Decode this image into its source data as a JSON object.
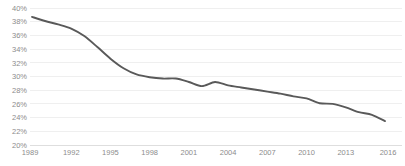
{
  "chart_data": {
    "type": "line",
    "title": "",
    "subtitle": "",
    "xlabel": "",
    "ylabel": "",
    "xlim": [
      1989,
      2016
    ],
    "ylim": [
      20,
      40
    ],
    "ytick_step": 2,
    "xtick_step": 3,
    "grid": true,
    "legend": false,
    "legend_position": "none",
    "value_suffix": "%",
    "line_color": "#595959",
    "grid_color": "#e8e8e8",
    "tick_label_color": "#8c8c8c",
    "background_color": "#ffffff",
    "ytick_labels": [
      "40%",
      "38%",
      "36%",
      "34%",
      "32%",
      "30%",
      "28%",
      "26%",
      "24%",
      "22%",
      "20%"
    ],
    "ytick_values": [
      40,
      38,
      36,
      34,
      32,
      30,
      28,
      26,
      24,
      22,
      20
    ],
    "xtick_labels": [
      "1989",
      "1992",
      "1995",
      "1998",
      "2001",
      "2004",
      "2007",
      "2010",
      "2013",
      "2016"
    ],
    "xtick_values": [
      1989,
      1992,
      1995,
      1998,
      2001,
      2004,
      2007,
      2010,
      2013,
      2016
    ],
    "series": [
      {
        "name": "share",
        "color": "#595959",
        "x": [
          1989,
          1990,
          1991,
          1992,
          1993,
          1994,
          1995,
          1996,
          1997,
          1998,
          1999,
          2000,
          2001,
          2002,
          2003,
          2004,
          2005,
          2006,
          2007,
          2008,
          2009,
          2010,
          2011,
          2012,
          2013,
          2014,
          2015,
          2016
        ],
        "values": [
          38.7,
          38.1,
          37.6,
          37.0,
          35.9,
          34.3,
          32.6,
          31.2,
          30.3,
          29.9,
          29.7,
          29.7,
          29.2,
          28.6,
          29.2,
          28.7,
          28.4,
          28.1,
          27.8,
          27.5,
          27.1,
          26.8,
          26.1,
          26.0,
          25.5,
          24.8,
          24.4,
          23.5
        ]
      }
    ]
  }
}
